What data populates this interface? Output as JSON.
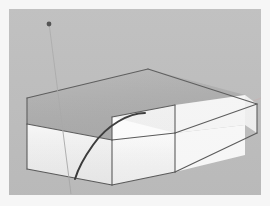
{
  "app": {
    "title": "3D Modeling Viewport",
    "tool_state_label": "Arc tool drawing on L-shaped extrusion"
  },
  "viewport": {
    "width": 252,
    "height": 186,
    "background_color": "#bdbdbd",
    "frame_color": "#f6f6f6",
    "frame_width_px": 9
  },
  "model": {
    "name": "l-shaped-solid",
    "description": "Extruded L-shaped rectangular solid viewed in isometric perspective",
    "colors": {
      "top_face": "#b2b2b2",
      "front_left_face": "#f2f2f2",
      "front_right_face": "#fbfbfb",
      "inner_notch_face": "#fdfdfd",
      "side_face_right": "#efefef",
      "edge_stroke": "#5a5a5a",
      "soft_edge_stroke": "#8d8d8d"
    },
    "faces": [
      {
        "id": "top-face",
        "label": "Top face",
        "fill": "#b2b2b2",
        "points": "18,89 139,60 236,86 166,96 166,124 103,108 103,131 18,115"
      },
      {
        "id": "front-left-face",
        "label": "Front left face",
        "fill": "#f3f3f3",
        "points": "18,115 103,131 103,176 18,160"
      },
      {
        "id": "front-mid-face",
        "label": "Front middle face",
        "fill": "#fcfcfc",
        "points": "103,131 166,124 166,163 103,176"
      },
      {
        "id": "notch-inner-left-face",
        "label": "Notch inner left face",
        "fill": "#fefefe",
        "points": "103,108 166,96 166,124 103,131"
      },
      {
        "id": "notch-inner-right-face",
        "label": "Notch inner right face",
        "fill": "#f7f7f7",
        "points": "166,96 236,86 236,116 166,124"
      },
      {
        "id": "right-end-face",
        "label": "Right end face",
        "fill": "#f0f0f0",
        "points": "236,86 248,95 248,124 236,116"
      },
      {
        "id": "right-front-face",
        "label": "Right front long face",
        "fill": "#fafafa",
        "points": "166,124 236,116 236,146 166,163"
      }
    ],
    "edges": [
      {
        "id": "edge-top-back-left",
        "label": "Top back left edge",
        "d": "M18,89 L139,60"
      },
      {
        "id": "edge-top-back-right",
        "label": "Top back right edge",
        "d": "M139,60 L248,95"
      },
      {
        "id": "edge-top-left",
        "label": "Top left edge",
        "d": "M18,89 L18,115"
      },
      {
        "id": "edge-top-front-left",
        "label": "Top front left edge",
        "d": "M18,115 L103,131"
      },
      {
        "id": "edge-notch-top",
        "label": "Notch top edge",
        "d": "M103,108 L166,96"
      },
      {
        "id": "edge-notch-vert",
        "label": "Notch vertical edge",
        "d": "M166,96 L166,124"
      },
      {
        "id": "edge-notch-inner",
        "label": "Notch inner edge",
        "d": "M103,108 L103,131"
      },
      {
        "id": "edge-notch-bottom",
        "label": "Notch bottom edge",
        "d": "M103,131 L166,124"
      },
      {
        "id": "edge-right-top",
        "label": "Right top edge",
        "d": "M166,124 L248,95"
      },
      {
        "id": "edge-right-vert",
        "label": "Right vertical edge",
        "d": "M248,95 L248,124"
      },
      {
        "id": "edge-right-bottom",
        "label": "Right bottom edge",
        "d": "M166,163 L248,124"
      },
      {
        "id": "edge-front-mid-vert",
        "label": "Front mid vertical",
        "d": "M166,124 L166,163"
      },
      {
        "id": "edge-front-left-vert",
        "label": "Front left vertical",
        "d": "M103,131 L103,176"
      },
      {
        "id": "edge-left-vert",
        "label": "Left vertical edge",
        "d": "M18,115 L18,160"
      },
      {
        "id": "edge-bottom-left",
        "label": "Bottom left edge",
        "d": "M18,160 L103,176"
      },
      {
        "id": "edge-bottom-front",
        "label": "Bottom front edge",
        "d": "M103,176 L166,163"
      }
    ]
  },
  "annotations": {
    "arc": {
      "name": "drawn-arc",
      "label": "Arc drawn across top and front face",
      "color": "#3a3a3a",
      "width": 2.0,
      "path": "M136,104 C120,104 98,116 84,136 C74,150 69,160 66,170"
    },
    "inference_line": {
      "name": "vertical-inference-line",
      "label": "Vertical blue inference / guide line",
      "color": "#a9a9a9",
      "width": 0.9,
      "path": "M40,14 L62,185"
    },
    "axis_line": {
      "name": "horizontal-axis-line",
      "label": "Horizontal red axis line at right",
      "color": "#c4b2b2",
      "width": 0.9,
      "path": "M244,92 L252,89"
    },
    "endpoint_marker": {
      "name": "endpoint-marker",
      "label": "Endpoint snap marker",
      "color": "#4b4b4b",
      "cx": 40,
      "cy": 15,
      "r": 2.4
    }
  }
}
